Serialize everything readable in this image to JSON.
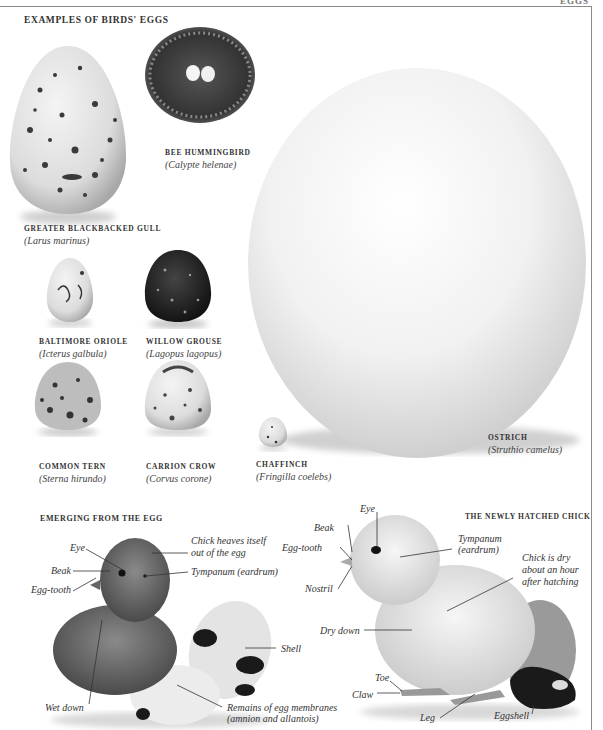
{
  "page": {
    "running_head": "EGGS"
  },
  "eggs_section": {
    "title": "EXAMPLES OF BIRDS' EGGS",
    "eggs": [
      {
        "common": "BEE HUMMINGBIRD",
        "scientific": "(Calypte helenae)"
      },
      {
        "common": "GREATER BLACKBACKED GULL",
        "scientific": "(Larus marinus)"
      },
      {
        "common": "BALTIMORE ORIOLE",
        "scientific": "(Icterus galbula)"
      },
      {
        "common": "WILLOW GROUSE",
        "scientific": "(Lagopus lagopus)"
      },
      {
        "common": "COMMON TERN",
        "scientific": "(Sterna hirundo)"
      },
      {
        "common": "CARRION CROW",
        "scientific": "(Corvus corone)"
      },
      {
        "common": "CHAFFINCH",
        "scientific": "(Fringilla coelebs)"
      },
      {
        "common": "OSTRICH",
        "scientific": "(Struthio camelus)"
      }
    ]
  },
  "emerging_section": {
    "title": "EMERGING FROM THE EGG",
    "labels": {
      "eye": "Eye",
      "beak": "Beak",
      "egg_tooth": "Egg-tooth",
      "heaves_1": "Chick heaves itself",
      "heaves_2": "out of  the egg",
      "tympanum": "Tympanum (eardrum)",
      "shell": "Shell",
      "wet_down": "Wet down",
      "remains_1": "Remains of  egg membranes",
      "remains_2": "(amnion and allantois)"
    }
  },
  "hatched_section": {
    "title": "THE NEWLY HATCHED CHICK",
    "labels": {
      "eye": "Eye",
      "beak": "Beak",
      "egg_tooth": "Egg-tooth",
      "nostril": "Nostril",
      "tympanum_1": "Tympanum",
      "tympanum_2": "(eardrum)",
      "dry_1": "Chick is dry",
      "dry_2": "about an hour",
      "dry_3": "after hatching",
      "dry_down": "Dry down",
      "toe": "Toe",
      "claw": "Claw",
      "leg": "Leg",
      "eggshell": "Eggshell"
    }
  },
  "colors": {
    "rule": "#8a8a8a",
    "text": "#2a2a2a",
    "background": "#ffffff"
  }
}
